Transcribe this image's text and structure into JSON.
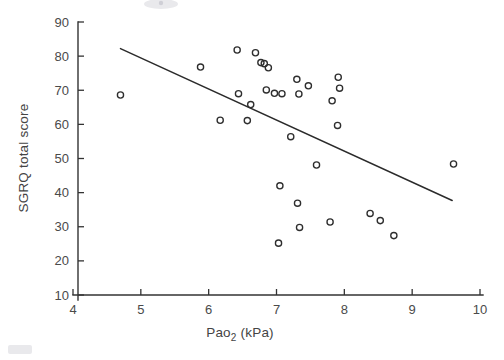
{
  "chart_data": {
    "type": "scatter",
    "title": "",
    "xlabel": "Pao2 (kPa)",
    "xlabel_base": "Pao",
    "xlabel_sub": "2",
    "xlabel_unit": " (kPa)",
    "ylabel": "SGRQ total score",
    "xlim": [
      4,
      10
    ],
    "ylim": [
      10,
      90
    ],
    "xticks": [
      4,
      5,
      6,
      7,
      8,
      9,
      10
    ],
    "xtick_labels": [
      "4",
      "5",
      "6",
      "7",
      "8",
      "9",
      "10"
    ],
    "yticks": [
      10,
      20,
      30,
      40,
      50,
      60,
      70,
      80,
      90
    ],
    "ytick_labels": [
      "10",
      "20",
      "30",
      "40",
      "50",
      "60",
      "70",
      "80",
      "90"
    ],
    "grid": false,
    "legend": "none",
    "marker": "open-circle",
    "marker_color": "#2e2e2e",
    "points": [
      {
        "x": 4.7,
        "y": 68.6
      },
      {
        "x": 5.88,
        "y": 76.8
      },
      {
        "x": 6.17,
        "y": 61.2
      },
      {
        "x": 6.42,
        "y": 81.8
      },
      {
        "x": 6.44,
        "y": 69.0
      },
      {
        "x": 6.57,
        "y": 61.1
      },
      {
        "x": 6.62,
        "y": 65.8
      },
      {
        "x": 6.69,
        "y": 81.0
      },
      {
        "x": 6.77,
        "y": 78.1
      },
      {
        "x": 6.82,
        "y": 77.8
      },
      {
        "x": 6.85,
        "y": 70.1
      },
      {
        "x": 6.88,
        "y": 76.6
      },
      {
        "x": 6.97,
        "y": 69.1
      },
      {
        "x": 7.03,
        "y": 25.2
      },
      {
        "x": 7.05,
        "y": 42.0
      },
      {
        "x": 7.08,
        "y": 69.0
      },
      {
        "x": 7.21,
        "y": 56.4
      },
      {
        "x": 7.3,
        "y": 73.2
      },
      {
        "x": 7.31,
        "y": 36.9
      },
      {
        "x": 7.33,
        "y": 68.9
      },
      {
        "x": 7.34,
        "y": 29.8
      },
      {
        "x": 7.47,
        "y": 71.3
      },
      {
        "x": 7.59,
        "y": 48.1
      },
      {
        "x": 7.79,
        "y": 31.4
      },
      {
        "x": 7.82,
        "y": 66.9
      },
      {
        "x": 7.9,
        "y": 59.7
      },
      {
        "x": 7.91,
        "y": 73.8
      },
      {
        "x": 7.93,
        "y": 70.6
      },
      {
        "x": 8.38,
        "y": 33.9
      },
      {
        "x": 8.53,
        "y": 31.8
      },
      {
        "x": 8.73,
        "y": 27.4
      },
      {
        "x": 9.61,
        "y": 48.4
      }
    ],
    "fit_line": {
      "label": "regression line",
      "x0": 4.7,
      "y0": 82.2,
      "x1": 9.59,
      "y1": 37.7
    }
  }
}
